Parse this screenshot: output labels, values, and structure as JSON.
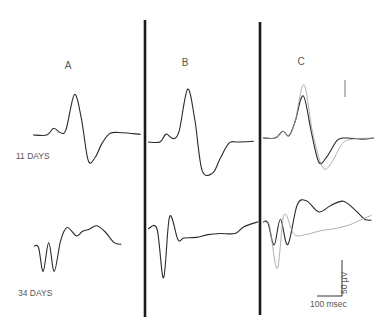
{
  "chart_data": {
    "type": "line",
    "title": "",
    "panels": [
      {
        "label": "A"
      },
      {
        "label": "B"
      },
      {
        "label": "C"
      }
    ],
    "row_labels": [
      "11 DAYS",
      "34 DAYS"
    ],
    "scale_bar": {
      "voltage_label": "50 µV",
      "time_label": "100 msec",
      "voltage_value_uV": 50,
      "time_value_ms": 100
    },
    "traces": [
      {
        "panel": "A",
        "row": "11 DAYS",
        "style": "dark",
        "points_ms_uV": [
          [
            0,
            0
          ],
          [
            30,
            0
          ],
          [
            45,
            12
          ],
          [
            60,
            4
          ],
          [
            72,
            10
          ],
          [
            90,
            72
          ],
          [
            105,
            30
          ],
          [
            120,
            -45
          ],
          [
            135,
            -40
          ],
          [
            150,
            -15
          ],
          [
            168,
            3
          ],
          [
            195,
            4
          ],
          [
            234,
            1
          ]
        ]
      },
      {
        "panel": "B",
        "row": "11 DAYS",
        "style": "dark",
        "points_ms_uV": [
          [
            0,
            0
          ],
          [
            20,
            0
          ],
          [
            30,
            14
          ],
          [
            42,
            6
          ],
          [
            52,
            20
          ],
          [
            66,
            94
          ],
          [
            78,
            40
          ],
          [
            90,
            -50
          ],
          [
            108,
            -55
          ],
          [
            120,
            -30
          ],
          [
            135,
            -2
          ],
          [
            150,
            0
          ],
          [
            176,
            1
          ]
        ]
      },
      {
        "panel": "C",
        "row": "11 DAYS",
        "style": "dark",
        "points_ms_uV": [
          [
            0,
            0
          ],
          [
            20,
            0
          ],
          [
            32,
            12
          ],
          [
            42,
            4
          ],
          [
            52,
            30
          ],
          [
            65,
            75
          ],
          [
            78,
            10
          ],
          [
            90,
            -43
          ],
          [
            102,
            -35
          ],
          [
            120,
            -4
          ],
          [
            135,
            0
          ],
          [
            160,
            -2
          ],
          [
            179,
            0
          ]
        ]
      },
      {
        "panel": "C",
        "row": "11 DAYS",
        "style": "light",
        "points_ms_uV": [
          [
            0,
            0
          ],
          [
            20,
            0
          ],
          [
            32,
            12
          ],
          [
            42,
            4
          ],
          [
            52,
            30
          ],
          [
            66,
            95
          ],
          [
            80,
            10
          ],
          [
            96,
            -52
          ],
          [
            110,
            -45
          ],
          [
            128,
            -10
          ],
          [
            145,
            -2
          ],
          [
            179,
            0
          ]
        ]
      },
      {
        "panel": "A",
        "row": "34 DAYS",
        "style": "dark",
        "points_ms_uV": [
          [
            0,
            0
          ],
          [
            10,
            -3
          ],
          [
            20,
            -45
          ],
          [
            32,
            6
          ],
          [
            44,
            -45
          ],
          [
            58,
            10
          ],
          [
            72,
            33
          ],
          [
            92,
            18
          ],
          [
            105,
            26
          ],
          [
            120,
            30
          ],
          [
            136,
            36
          ],
          [
            155,
            25
          ],
          [
            174,
            6
          ],
          [
            190,
            3
          ]
        ]
      },
      {
        "panel": "B",
        "row": "34 DAYS",
        "style": "dark",
        "points_ms_uV": [
          [
            0,
            0
          ],
          [
            15,
            0
          ],
          [
            26,
            -87
          ],
          [
            36,
            22
          ],
          [
            50,
            -19
          ],
          [
            60,
            -16
          ],
          [
            80,
            -15
          ],
          [
            100,
            -10
          ],
          [
            120,
            -8
          ],
          [
            145,
            -8
          ],
          [
            160,
            4
          ],
          [
            184,
            13
          ]
        ]
      },
      {
        "panel": "C",
        "row": "34 DAYS",
        "style": "dark",
        "points_ms_uV": [
          [
            0,
            0
          ],
          [
            8,
            -2
          ],
          [
            18,
            -41
          ],
          [
            28,
            5
          ],
          [
            40,
            -40
          ],
          [
            55,
            30
          ],
          [
            70,
            38
          ],
          [
            90,
            18
          ],
          [
            110,
            30
          ],
          [
            130,
            37
          ],
          [
            150,
            20
          ],
          [
            164,
            5
          ],
          [
            175,
            3
          ]
        ]
      },
      {
        "panel": "C",
        "row": "34 DAYS",
        "style": "light",
        "points_ms_uV": [
          [
            0,
            0
          ],
          [
            10,
            -5
          ],
          [
            23,
            -83
          ],
          [
            34,
            13
          ],
          [
            50,
            -22
          ],
          [
            70,
            -22
          ],
          [
            95,
            -15
          ],
          [
            115,
            -12
          ],
          [
            140,
            -5
          ],
          [
            160,
            5
          ],
          [
            175,
            12
          ]
        ]
      }
    ]
  }
}
